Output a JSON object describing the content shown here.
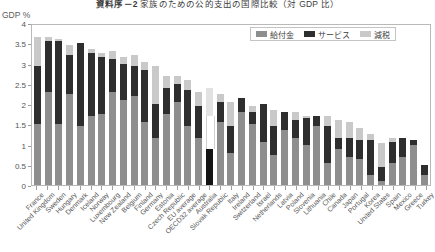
{
  "figure": {
    "title_number": "資料序－2",
    "title_main": "家族のための公的支出の国際比較（対 GDP 比）",
    "axis_unit": "GDP %"
  },
  "legend": {
    "position": "top-right",
    "items": [
      {
        "label": "給付金",
        "key": "cash",
        "color": "#8e8e8e"
      },
      {
        "label": "サービス",
        "key": "service",
        "color": "#2e2e2e"
      },
      {
        "label": "減税",
        "key": "tax",
        "color": "#c9c9c9"
      }
    ]
  },
  "chart_data": {
    "type": "bar",
    "stacked": true,
    "xlabel": "",
    "ylabel": "GDP %",
    "ylim": [
      0,
      4
    ],
    "yticks": [
      0,
      0.5,
      1,
      1.5,
      2,
      2.5,
      3,
      3.5,
      4
    ],
    "ytick_labels": [
      "0",
      "0.5",
      "1",
      "1.5",
      "2",
      "2.5",
      "3",
      "3.5",
      "4"
    ],
    "grid": false,
    "legend_entries": [
      "給付金",
      "サービス",
      "減税"
    ],
    "categories": [
      "France",
      "United Kingdom",
      "Sweden",
      "Hungary",
      "Denmark",
      "Iceland",
      "Norway",
      "Luxembourg",
      "New Zealand",
      "Belgium",
      "Finland",
      "Germany",
      "Estonia",
      "Czech Republic",
      "EU average",
      "OECD32 average",
      "Australia",
      "Slovak Republic",
      "Italy",
      "Ireland",
      "Switzerland",
      "Israel",
      "Netherlands",
      "Latvia",
      "Poland",
      "Slovenia",
      "Lithuania",
      "Chile",
      "Canada",
      "Japan",
      "Portugal",
      "Korea",
      "United States",
      "Spain",
      "Mexico",
      "Greece",
      "Turkey"
    ],
    "series": [
      {
        "name": "給付金",
        "key": "cash",
        "color": "#8e8e8e",
        "values": [
          1.5,
          2.3,
          1.5,
          2.25,
          1.45,
          1.7,
          1.75,
          2.3,
          2.1,
          2.2,
          1.55,
          1.15,
          1.75,
          2.05,
          1.45,
          1.15,
          0.9,
          1.55,
          0.8,
          1.8,
          1.5,
          1.05,
          0.75,
          1.35,
          1.15,
          1.0,
          1.45,
          0.55,
          0.9,
          0.7,
          0.65,
          0.25,
          0.1,
          0.55,
          0.7,
          1.0,
          0.25
        ]
      },
      {
        "name": "サービス",
        "key": "service",
        "color": "#2e2e2e",
        "values": [
          1.45,
          1.25,
          2.05,
          0.95,
          2.05,
          1.55,
          1.4,
          0.8,
          0.9,
          0.75,
          1.3,
          0.85,
          0.65,
          0.45,
          0.9,
          0.8,
          0.8,
          0.5,
          0.65,
          0.35,
          0.3,
          0.95,
          0.7,
          0.45,
          0.45,
          0.65,
          0.25,
          0.9,
          0.25,
          0.45,
          0.45,
          0.85,
          0.35,
          0.5,
          0.45,
          0.1,
          0.25
        ]
      },
      {
        "name": "減税",
        "key": "tax",
        "color": "#c9c9c9",
        "values": [
          0.7,
          0.1,
          0.05,
          0.25,
          0.0,
          0.1,
          0.1,
          0.2,
          0.15,
          0.25,
          0.2,
          0.95,
          0.3,
          0.2,
          0.25,
          0.35,
          0.7,
          0.2,
          0.6,
          0.0,
          0.15,
          0.0,
          0.4,
          0.0,
          0.2,
          0.05,
          0.0,
          0.25,
          0.45,
          0.4,
          0.3,
          0.15,
          0.6,
          0.1,
          0.0,
          0.0,
          0.0
        ]
      }
    ],
    "totals": [
      3.65,
      3.65,
      3.6,
      3.45,
      3.5,
      3.35,
      3.25,
      3.3,
      3.15,
      3.2,
      3.05,
      2.95,
      2.7,
      2.7,
      2.6,
      2.3,
      2.4,
      2.25,
      2.05,
      2.15,
      1.95,
      2.0,
      1.85,
      1.8,
      1.8,
      1.7,
      1.7,
      1.7,
      1.6,
      1.55,
      1.4,
      1.25,
      1.05,
      1.15,
      1.15,
      1.1,
      0.5
    ],
    "special_styles": {
      "16": "outlined"
    }
  }
}
